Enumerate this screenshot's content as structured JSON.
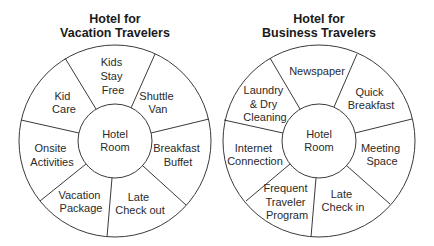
{
  "diagrams": [
    {
      "title_line1": "Hotel for",
      "title_line2": "Vacation Travelers",
      "center_label": [
        "Hotel",
        "Room"
      ],
      "segments": [
        {
          "lines": [
            "Kids",
            "Stay",
            "Free"
          ]
        },
        {
          "lines": [
            "Shuttle",
            "Van"
          ]
        },
        {
          "lines": [
            "Breakfast",
            "Buffet"
          ]
        },
        {
          "lines": [
            "Late",
            "Check out"
          ]
        },
        {
          "lines": [
            "Vacation",
            "Package"
          ]
        },
        {
          "lines": [
            "Onsite",
            "Activities"
          ]
        },
        {
          "lines": [
            "Kid",
            "Care"
          ]
        }
      ]
    },
    {
      "title_line1": "Hotel for",
      "title_line2": "Business Travelers",
      "center_label": [
        "Hotel",
        "Room"
      ],
      "segments": [
        {
          "lines": [
            "Newspaper"
          ]
        },
        {
          "lines": [
            "Quick",
            "Breakfast"
          ]
        },
        {
          "lines": [
            "Meeting",
            "Space"
          ]
        },
        {
          "lines": [
            "Late",
            "Check in"
          ]
        },
        {
          "lines": [
            "Frequent",
            "Traveler",
            "Program"
          ]
        },
        {
          "lines": [
            "Internet",
            "Connection"
          ]
        },
        {
          "lines": [
            "Laundry",
            "& Dry",
            "Cleaning"
          ]
        }
      ]
    }
  ],
  "colors": {
    "stroke": "#3a3a3a",
    "text": "#2a2a2a",
    "background": "#ffffff"
  }
}
